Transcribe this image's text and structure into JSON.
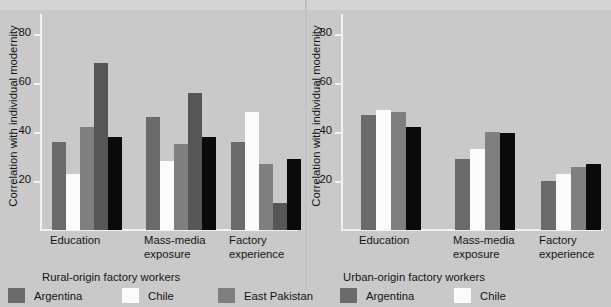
{
  "figure": {
    "background_color": "#c9c9c9",
    "y_axis_title": "Correlation with individual modernity",
    "y_ticks": [
      ".80",
      ".60",
      ".40",
      ".20"
    ],
    "y_tick_values": [
      0.8,
      0.6,
      0.4,
      0.2
    ],
    "categories": [
      {
        "line1": "Education",
        "line2": ""
      },
      {
        "line1": "Mass-media",
        "line2": "exposure"
      },
      {
        "line1": "Factory",
        "line2": "experience"
      }
    ]
  },
  "panels": [
    {
      "id": "rural",
      "caption": "Rural-origin factory workers",
      "legend": [
        {
          "label": "Argentina",
          "color": "#6b6b6b"
        },
        {
          "label": "Chile",
          "color": "#fbfbfb"
        },
        {
          "label": "East Pakistan",
          "color": "#7f7f7f"
        }
      ]
    },
    {
      "id": "urban",
      "caption": "Urban-origin factory workers",
      "legend": [
        {
          "label": "Argentina",
          "color": "#6b6b6b"
        },
        {
          "label": "Chile",
          "color": "#fbfbfb"
        }
      ]
    }
  ],
  "chart_data": [
    {
      "type": "bar",
      "title": "Rural-origin factory workers",
      "xlabel": "",
      "ylabel": "Correlation with individual modernity",
      "ylim": [
        0,
        0.88
      ],
      "grid": false,
      "legend_position": "bottom",
      "categories": [
        "Education",
        "Mass-media exposure",
        "Factory experience"
      ],
      "series": [
        {
          "name": "Argentina",
          "color": "#6b6b6b",
          "values": [
            0.36,
            0.46,
            0.36
          ]
        },
        {
          "name": "Chile",
          "color": "#fbfbfb",
          "values": [
            0.23,
            0.28,
            0.48
          ]
        },
        {
          "name": "East Pakistan",
          "color": "#7f7f7f",
          "values": [
            0.42,
            0.35,
            0.27
          ]
        },
        {
          "name": "series-4",
          "color": "#565656",
          "values": [
            0.68,
            0.56,
            0.11
          ]
        },
        {
          "name": "series-5",
          "color": "#0a0a0a",
          "values": [
            0.38,
            0.38,
            0.29
          ]
        }
      ]
    },
    {
      "type": "bar",
      "title": "Urban-origin factory workers",
      "xlabel": "",
      "ylabel": "Correlation with individual modernity",
      "ylim": [
        0,
        0.88
      ],
      "grid": false,
      "legend_position": "bottom",
      "categories": [
        "Education",
        "Mass-media exposure",
        "Factory experience"
      ],
      "series": [
        {
          "name": "Argentina",
          "color": "#6b6b6b",
          "values": [
            0.47,
            0.29,
            0.2
          ]
        },
        {
          "name": "Chile",
          "color": "#fbfbfb",
          "values": [
            0.49,
            0.33,
            0.23
          ]
        },
        {
          "name": "East Pakistan",
          "color": "#7f7f7f",
          "values": [
            0.48,
            0.4,
            0.255
          ]
        },
        {
          "name": "series-4",
          "color": "#0a0a0a",
          "values": [
            0.42,
            0.395,
            0.27
          ]
        }
      ]
    }
  ]
}
